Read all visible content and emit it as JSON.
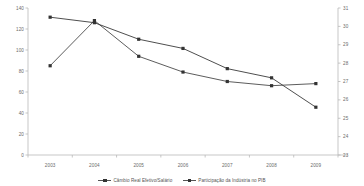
{
  "chart_data": {
    "type": "line",
    "title": "",
    "xlabel": "",
    "categories": [
      "2003",
      "2004",
      "2005",
      "2006",
      "2007",
      "2008",
      "2009"
    ],
    "grid": false,
    "legend_position": "bottom",
    "axes": {
      "left": {
        "label": "",
        "ylim": [
          0,
          140
        ],
        "ticks": [
          "140",
          "120",
          "100",
          "80",
          "60",
          "40",
          "20",
          "0"
        ]
      },
      "right": {
        "label": "",
        "ylim": [
          23,
          31
        ],
        "ticks": [
          "31",
          "30",
          "29",
          "28",
          "27",
          "26",
          "25",
          "24",
          "23"
        ]
      }
    },
    "series": [
      {
        "name": "Câmbio Real Efetivo/Salário",
        "axis": "left",
        "color": "#4a4a4a",
        "values": [
          85,
          128,
          94,
          79,
          70,
          66,
          68
        ]
      },
      {
        "name": "Participação da Indústria no PIB",
        "axis": "right",
        "color": "#3a3a3a",
        "values": [
          30.5,
          30.2,
          29.3,
          28.8,
          27.7,
          27.2,
          25.6
        ]
      }
    ]
  },
  "legend": {
    "items": [
      {
        "label": "Câmbio Real Efetivo/Salário"
      },
      {
        "label": "Participação da Indústria no PIB"
      }
    ]
  }
}
